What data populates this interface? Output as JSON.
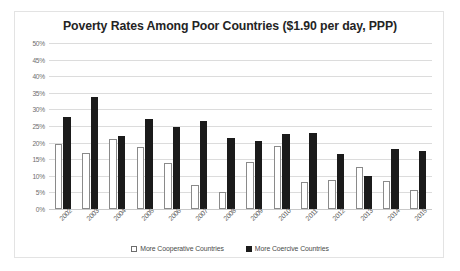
{
  "chart_data": {
    "type": "bar",
    "title": "Poverty Rates Among Poor Countries ($1.90 per day, PPP)",
    "xlabel": "",
    "ylabel": "",
    "ylim": [
      0,
      50
    ],
    "ytick_step": 5,
    "ytick_labels": [
      "50%",
      "45%",
      "40%",
      "35%",
      "30%",
      "25%",
      "20%",
      "15%",
      "10%",
      "5%",
      "0%"
    ],
    "ytick_values": [
      50,
      45,
      40,
      35,
      30,
      25,
      20,
      15,
      10,
      5,
      0
    ],
    "grid": true,
    "legend_position": "bottom",
    "categories": [
      "2002",
      "2003",
      "2004",
      "2005",
      "2006",
      "2007",
      "2008",
      "2009",
      "2010",
      "2011",
      "2012",
      "2013",
      "2014",
      "2015"
    ],
    "series": [
      {
        "name": "More Cooperative Countries",
        "color": "#ffffff",
        "edge_color": "#8a8a8a",
        "values": [
          19.5,
          17,
          21,
          18.7,
          14,
          7.3,
          5.2,
          14.2,
          19,
          8,
          8.7,
          12.8,
          8.4,
          5.8
        ]
      },
      {
        "name": "More Coercive Countries",
        "color": "#1b1b1b",
        "edge_color": "#1b1b1b",
        "values": [
          27.6,
          33.8,
          22,
          27,
          24.6,
          26.5,
          21.5,
          20.6,
          22.5,
          23,
          16.5,
          9.8,
          18,
          17.4
        ]
      }
    ]
  }
}
